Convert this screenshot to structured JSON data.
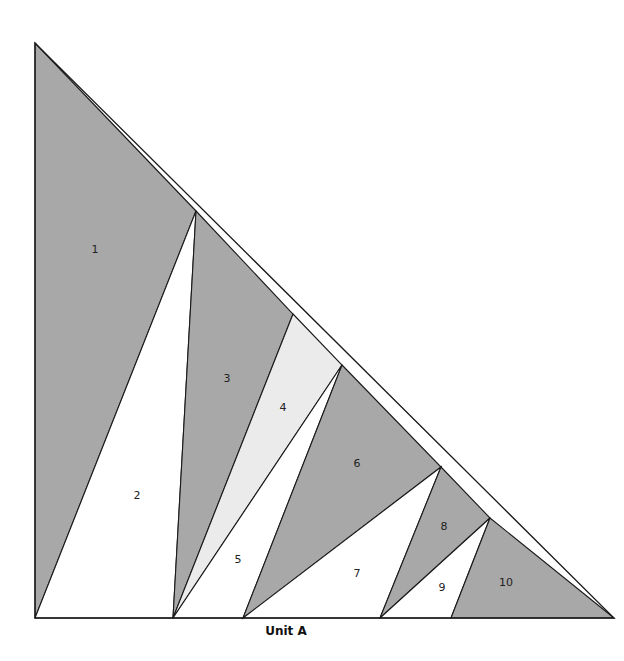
{
  "diagram": {
    "title": "Unit A",
    "colors": {
      "dark": "#a8a8a8",
      "light": "#ebebeb",
      "white": "#ffffff",
      "outline": "#1a1a1a"
    },
    "outer_triangle": [
      [
        35,
        43
      ],
      [
        35,
        618
      ],
      [
        614,
        618
      ]
    ],
    "pieces": [
      {
        "id": "1",
        "label": "1",
        "fill": "dark",
        "points": [
          [
            35,
            43
          ],
          [
            196,
            211
          ],
          [
            35,
            618
          ]
        ],
        "label_pos": [
          95,
          250
        ]
      },
      {
        "id": "2",
        "label": "2",
        "fill": "white",
        "points": [
          [
            196,
            211
          ],
          [
            173,
            618
          ],
          [
            35,
            618
          ]
        ],
        "label_pos": [
          137,
          496
        ]
      },
      {
        "id": "3",
        "label": "3",
        "fill": "dark",
        "points": [
          [
            196,
            211
          ],
          [
            293,
            314
          ],
          [
            173,
            618
          ]
        ],
        "label_pos": [
          227,
          379
        ]
      },
      {
        "id": "4",
        "label": "4",
        "fill": "light",
        "points": [
          [
            293,
            314
          ],
          [
            342,
            365
          ],
          [
            173,
            618
          ]
        ],
        "label_pos": [
          283,
          408
        ]
      },
      {
        "id": "5",
        "label": "5",
        "fill": "white",
        "points": [
          [
            342,
            365
          ],
          [
            243,
            618
          ],
          [
            173,
            618
          ]
        ],
        "label_pos": [
          238,
          560
        ]
      },
      {
        "id": "6",
        "label": "6",
        "fill": "dark",
        "points": [
          [
            342,
            365
          ],
          [
            441,
            467
          ],
          [
            243,
            618
          ]
        ],
        "label_pos": [
          357,
          464
        ]
      },
      {
        "id": "7",
        "label": "7",
        "fill": "white",
        "points": [
          [
            441,
            467
          ],
          [
            380,
            618
          ],
          [
            243,
            618
          ]
        ],
        "label_pos": [
          357,
          574
        ]
      },
      {
        "id": "8",
        "label": "8",
        "fill": "dark",
        "points": [
          [
            441,
            467
          ],
          [
            490,
            518
          ],
          [
            380,
            618
          ]
        ],
        "label_pos": [
          444,
          527
        ]
      },
      {
        "id": "9",
        "label": "9",
        "fill": "white",
        "points": [
          [
            490,
            518
          ],
          [
            451,
            618
          ],
          [
            380,
            618
          ]
        ],
        "label_pos": [
          442,
          588
        ]
      },
      {
        "id": "10",
        "label": "10",
        "fill": "dark",
        "points": [
          [
            490,
            518
          ],
          [
            614,
            618
          ],
          [
            451,
            618
          ]
        ],
        "label_pos": [
          506,
          583
        ]
      }
    ]
  }
}
